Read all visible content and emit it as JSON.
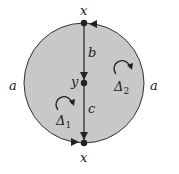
{
  "diagram": {
    "type": "van Kampen diagram",
    "colors": {
      "disk_fill": "#c8c8c8",
      "stroke": "#333333",
      "text": "#222222"
    },
    "vertices": {
      "top": "x",
      "middle": "y",
      "bottom": "x"
    },
    "edges": {
      "boundary_left": "a",
      "boundary_right": "a",
      "upper_segment": "b",
      "lower_segment": "c"
    },
    "faces": {
      "left": {
        "label": "Δ",
        "subscript": "1"
      },
      "right": {
        "label": "Δ",
        "subscript": "2"
      }
    }
  }
}
